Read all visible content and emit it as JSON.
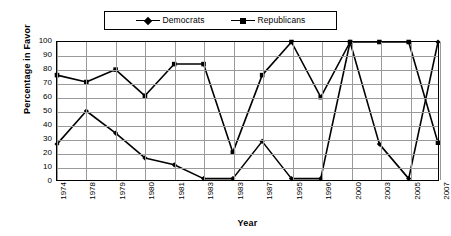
{
  "chart_data": {
    "type": "line",
    "title": "",
    "xlabel": "Year",
    "ylabel": "Percentage in Favor",
    "ylim": [
      0,
      100
    ],
    "ytick_step": 10,
    "yticks": [
      100,
      90,
      80,
      70,
      60,
      50,
      40,
      30,
      20,
      10,
      0
    ],
    "grid": true,
    "legend_position": "top-center",
    "categories": [
      "1974",
      "1978",
      "1979",
      "1980",
      "1981",
      "1983",
      "1983",
      "1987",
      "1995",
      "1996",
      "2000",
      "2003",
      "2005",
      "2007"
    ],
    "series": [
      {
        "name": "Democrats",
        "marker": "diamond",
        "color": "#000000",
        "values": [
          26,
          50,
          34,
          16,
          11,
          1,
          1,
          28,
          1,
          1,
          100,
          26,
          1,
          100
        ]
      },
      {
        "name": "Republicans",
        "marker": "square",
        "color": "#000000",
        "values": [
          76,
          71,
          80,
          61,
          84,
          84,
          20,
          76,
          100,
          60,
          100,
          100,
          100,
          27
        ]
      }
    ]
  },
  "legend": {
    "entries": [
      {
        "label": "Democrats"
      },
      {
        "label": "Republicans"
      }
    ]
  },
  "axes": {
    "y_title": "Percentage in Favor",
    "x_title": "Year"
  }
}
